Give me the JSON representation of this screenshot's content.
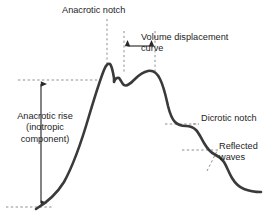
{
  "figure": {
    "background_color": "#ffffff",
    "curve_color": "#3a3a3a",
    "annotation_color": "#1d1d1d",
    "dash_color": "#9a9a9a",
    "arrow_color": "#2a2a2a"
  },
  "labels": {
    "anacrotic_notch": "Anacrotic notch",
    "volume_displacement_line1": "Volume displacement",
    "volume_displacement_line2": "curve",
    "anacrotic_rise_line1": "Anacrotic rise",
    "anacrotic_rise_line2": "(inotropic",
    "anacrotic_rise_line3": "component)",
    "dicrotic_notch": "Dicrotic notch",
    "reflected_waves_line1": "Reflected",
    "reflected_waves_line2": "waves"
  },
  "chart_data": {
    "type": "line",
    "title": "",
    "xlabel": "",
    "ylabel": "",
    "grid": false,
    "legend": "none",
    "xlim": [
      0,
      275
    ],
    "ylim": [
      0,
      216
    ],
    "series": [
      {
        "name": "arterial-pressure-waveform",
        "path": "M 36 209 C 46 203, 56 195, 64 182 C 74 164, 82 140, 89 116 C 95 96, 100 80, 104 70 C 106 65, 108 63, 110 64 C 112 66, 113 72, 114 78 C 114 81, 114 82, 114 82 C 115 79, 117 77, 119 78 C 121 80, 122 84, 124 85 C 127 87, 131 83, 135 79 C 139 75, 143 72, 148 71 C 153 70, 157 73, 160 79 C 164 87, 166 97, 168 106 C 170 114, 172 119, 175 122 C 178 125, 182 126, 186 126 C 190 126, 193 127, 196 130 C 199 133, 201 138, 204 143 C 207 148, 210 152, 214 154 C 218 156, 221 158, 224 162 C 227 167, 229 173, 232 178 C 235 183, 239 187, 244 189 C 249 191, 255 192, 261 192"
      }
    ],
    "features": [
      {
        "name": "anacrotic-notch",
        "x": 114,
        "y": 82,
        "description": "sharp early systolic peak followed by small dip"
      },
      {
        "name": "volume-displacement-curve",
        "x": 148,
        "y": 71,
        "description": "broad rounded systolic dome"
      },
      {
        "name": "dicrotic-notch",
        "x": 189,
        "y": 126,
        "description": "plateau step on downslope"
      },
      {
        "name": "reflected-waves",
        "x": 222,
        "y": 160,
        "description": "step-like oscillations on late downslope"
      }
    ],
    "markers": {
      "anacrotic_rise_top_y": 80,
      "anacrotic_rise_bottom_y": 207,
      "anacrotic_rise_arrow_x": 41,
      "baseline_y": 207,
      "vertical_guide_x": [
        107,
        124,
        155
      ],
      "horizontal_span_y": 46
    }
  }
}
